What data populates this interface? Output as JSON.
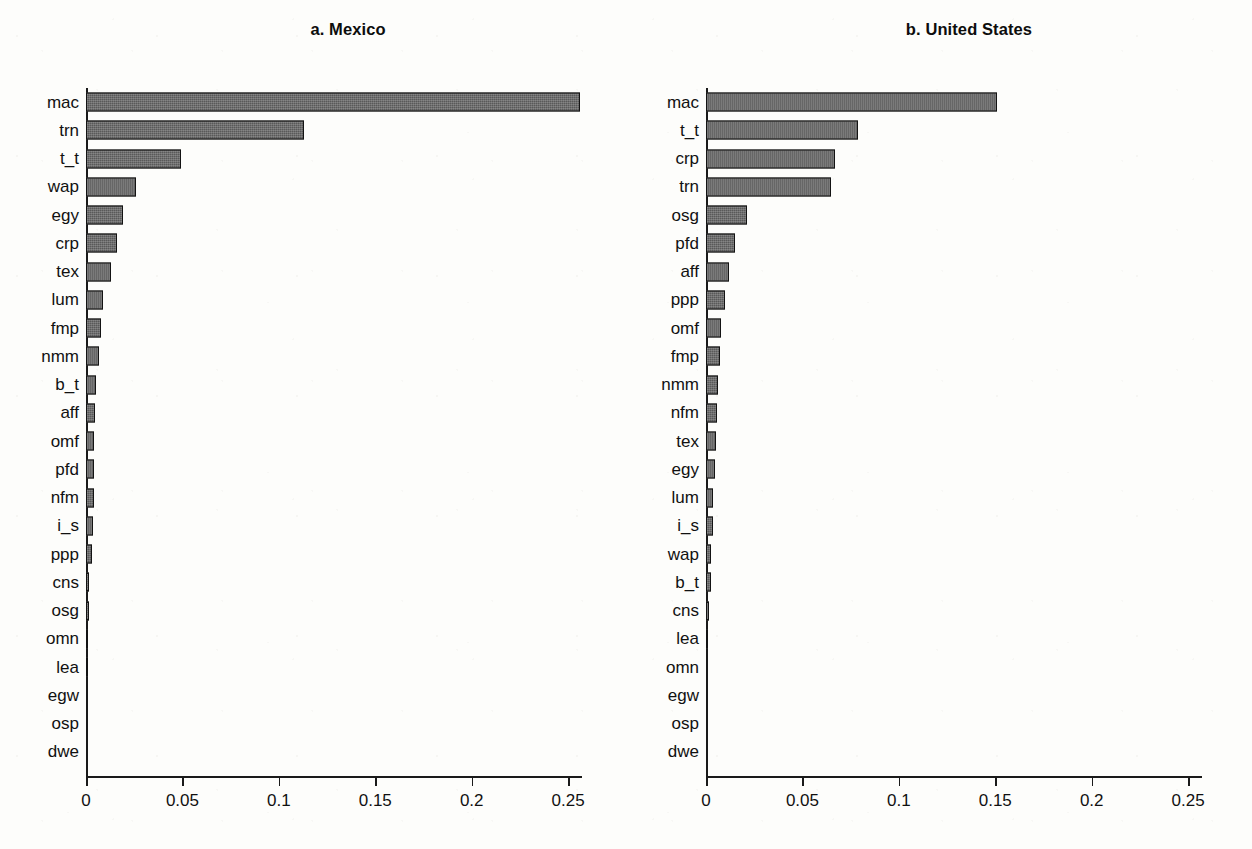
{
  "figure": {
    "background_color": "#fdfdfb",
    "bar_fill_color": "#595959",
    "bar_edge_color": "#131313"
  },
  "chart_data": [
    {
      "type": "bar",
      "orientation": "horizontal",
      "title": "a. Mexico",
      "xlabel": "",
      "ylabel": "",
      "xlim": [
        0,
        0.28
      ],
      "xticks": [
        0,
        0.05,
        0.1,
        0.15,
        0.2,
        0.25
      ],
      "xticklabels": [
        "0",
        "0.05",
        "0.1",
        "0.15",
        "0.2",
        "0.25"
      ],
      "grid": false,
      "legend": false,
      "categories": [
        "mac",
        "trn",
        "t_t",
        "wap",
        "egy",
        "crp",
        "tex",
        "lum",
        "fmp",
        "nmm",
        "b_t",
        "aff",
        "omf",
        "pfd",
        "nfm",
        "i_s",
        "ppp",
        "cns",
        "osg",
        "omn",
        "lea",
        "egw",
        "osp",
        "dwe"
      ],
      "values": [
        0.256,
        0.113,
        0.049,
        0.026,
        0.019,
        0.016,
        0.013,
        0.009,
        0.0076,
        0.0068,
        0.0052,
        0.0046,
        0.0044,
        0.0042,
        0.004,
        0.0038,
        0.003,
        0.0014,
        0.0013,
        0.0012,
        0.0011,
        0.0002,
        0.0001,
        0.0
      ]
    },
    {
      "type": "bar",
      "orientation": "horizontal",
      "title": "b. United States",
      "xlabel": "",
      "ylabel": "",
      "xlim": [
        0,
        0.28
      ],
      "xticks": [
        0,
        0.05,
        0.1,
        0.15,
        0.2,
        0.25
      ],
      "xticklabels": [
        "0",
        "0.05",
        "0.1",
        "0.15",
        "0.2",
        "0.25"
      ],
      "grid": false,
      "legend": false,
      "categories": [
        "mac",
        "t_t",
        "crp",
        "trn",
        "osg",
        "pfd",
        "aff",
        "ppp",
        "omf",
        "fmp",
        "nmm",
        "nfm",
        "tex",
        "egy",
        "lum",
        "i_s",
        "wap",
        "b_t",
        "cns",
        "lea",
        "omn",
        "egw",
        "osp",
        "dwe"
      ],
      "values": [
        0.151,
        0.079,
        0.067,
        0.065,
        0.021,
        0.015,
        0.012,
        0.0098,
        0.008,
        0.0072,
        0.006,
        0.0055,
        0.0052,
        0.0048,
        0.0038,
        0.0034,
        0.0026,
        0.0024,
        0.0016,
        0.0008,
        0.0005,
        0.0004,
        0.0001,
        0.0
      ]
    }
  ]
}
